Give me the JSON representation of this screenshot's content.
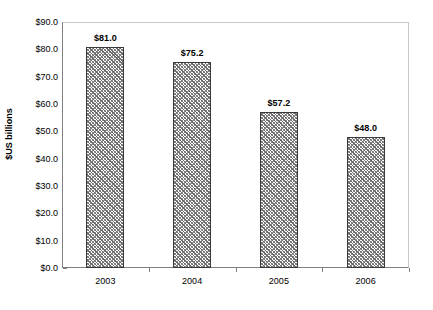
{
  "chart_data": {
    "type": "bar",
    "title": "",
    "subtitle": "",
    "xlabel": "",
    "ylabel": "$US billions",
    "categories": [
      "2003",
      "2004",
      "2005",
      "2006"
    ],
    "values": [
      81.0,
      75.2,
      57.2,
      48.0
    ],
    "data_labels": [
      "$81.0",
      "$75.2",
      "$57.2",
      "$48.0"
    ],
    "ylim": [
      0,
      90
    ],
    "ytick_step": 10,
    "ytick_labels": [
      "$90.0",
      "$80.0",
      "$70.0",
      "$60.0",
      "$50.0",
      "$40.0",
      "$30.0",
      "$20.0",
      "$10.0",
      "$0.0"
    ],
    "ytick_values": [
      90,
      80,
      70,
      60,
      50,
      40,
      30,
      20,
      10,
      0
    ],
    "grid": false,
    "legend": false,
    "legend_position": "none",
    "series": [
      {
        "name": "",
        "values": [
          81.0,
          75.2,
          57.2,
          48.0
        ],
        "fill": "diagonal-hatch-gray",
        "fill_color": "#808080",
        "border_color": "#3a3a3a"
      }
    ],
    "axis_color": "#808080",
    "plot_border_color": "#c8c8c8",
    "background_color": "#ffffff",
    "text_color": "#000000"
  }
}
